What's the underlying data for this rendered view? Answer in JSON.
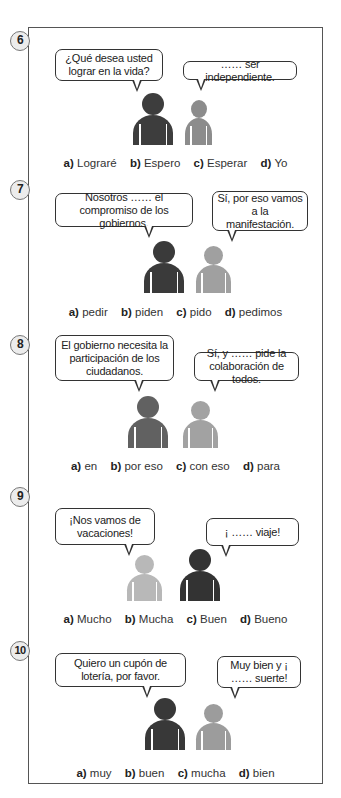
{
  "exercises": [
    {
      "number": "6",
      "bubble_left": "¿Qué desea usted lograr en la vida?",
      "bubble_right": "…… ser independiente.",
      "figures": [
        {
          "shade": "dark",
          "color": "#3d3d3d"
        },
        {
          "shade": "light",
          "color": "#8c8c8c"
        }
      ],
      "options": [
        {
          "letter": "a)",
          "text": "Lograré"
        },
        {
          "letter": "b)",
          "text": "Espero"
        },
        {
          "letter": "c)",
          "text": "Esperar"
        },
        {
          "letter": "d)",
          "text": "Yo"
        }
      ]
    },
    {
      "number": "7",
      "bubble_left": "Nosotros …… el compromiso de los gobiernos.",
      "bubble_right": "Sí, por eso vamos a la manifestación.",
      "figures": [
        {
          "shade": "dark",
          "color": "#3a3a3a"
        },
        {
          "shade": "light",
          "color": "#a0a0a0"
        }
      ],
      "options": [
        {
          "letter": "a)",
          "text": "pedir"
        },
        {
          "letter": "b)",
          "text": "piden"
        },
        {
          "letter": "c)",
          "text": "pido"
        },
        {
          "letter": "d)",
          "text": "pedimos"
        }
      ]
    },
    {
      "number": "8",
      "bubble_left": "El gobierno necesita la participación de los ciudadanos.",
      "bubble_right": "Sí, y …… pide la colaboración de todos.",
      "figures": [
        {
          "shade": "medium",
          "color": "#616161"
        },
        {
          "shade": "light",
          "color": "#a2a2a2"
        }
      ],
      "options": [
        {
          "letter": "a)",
          "text": "en"
        },
        {
          "letter": "b)",
          "text": "por eso"
        },
        {
          "letter": "c)",
          "text": "con eso"
        },
        {
          "letter": "d)",
          "text": "para"
        }
      ]
    },
    {
      "number": "9",
      "bubble_left": "¡Nos vamos de vacaciones!",
      "bubble_right": "¡ …… viaje!",
      "figures": [
        {
          "shade": "light",
          "color": "#b8b8b8"
        },
        {
          "shade": "dark",
          "color": "#333333"
        }
      ],
      "options": [
        {
          "letter": "a)",
          "text": "Mucho"
        },
        {
          "letter": "b)",
          "text": "Mucha"
        },
        {
          "letter": "c)",
          "text": "Buen"
        },
        {
          "letter": "d)",
          "text": "Bueno"
        }
      ]
    },
    {
      "number": "10",
      "bubble_left": "Quiero un cupón de lotería, por favor.",
      "bubble_right": "Muy bien y ¡ …… suerte!",
      "figures": [
        {
          "shade": "dark",
          "color": "#383838"
        },
        {
          "shade": "light",
          "color": "#9c9c9c"
        }
      ],
      "options": [
        {
          "letter": "a)",
          "text": "muy"
        },
        {
          "letter": "b)",
          "text": "buen"
        },
        {
          "letter": "c)",
          "text": "mucha"
        },
        {
          "letter": "d)",
          "text": "bien"
        }
      ]
    }
  ]
}
